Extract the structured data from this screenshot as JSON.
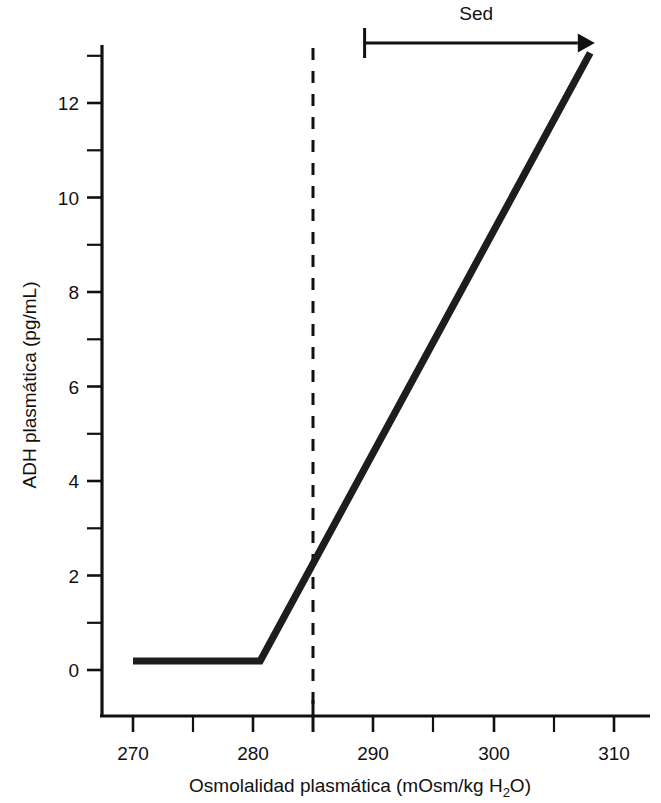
{
  "chart_data": {
    "type": "line",
    "title": "",
    "subtitle": "",
    "xlabel_parts": {
      "pre": "Osmolalidad plasmática (mOsm/kg H",
      "sub": "2",
      "post": "O)"
    },
    "xlabel": "Osmolalidad plasmática (mOsm/kg H2O)",
    "ylabel": "ADH plasmática (pg/mL)",
    "xlim": [
      266,
      312
    ],
    "ylim": [
      -0.7,
      13.6
    ],
    "grid": false,
    "legend": "none",
    "x_major_ticks": [
      270,
      280,
      290,
      300,
      310
    ],
    "x_major_tick_labels": [
      "270",
      "280",
      "290",
      "300",
      "310"
    ],
    "x_minor_ticks": [
      275,
      285,
      295,
      305
    ],
    "y_major_ticks": [
      0,
      2,
      4,
      6,
      8,
      10,
      12
    ],
    "y_major_tick_labels": [
      "0",
      "2",
      "4",
      "6",
      "8",
      "10",
      "12"
    ],
    "y_minor_ticks": [
      1,
      3,
      5,
      7,
      9,
      11,
      13
    ],
    "series": [
      {
        "name": "ADH plasmática",
        "color": "#1d1d1d",
        "x": [
          270.0,
          280.6,
          308.1
        ],
        "values": [
          0.19,
          0.19,
          13.06
        ]
      }
    ],
    "reference_lines": [
      {
        "name": "umbral-osmotico",
        "orientation": "vertical",
        "x": 285,
        "style": "dashed",
        "color": "#111111",
        "label": ""
      }
    ],
    "annotations": [
      {
        "name": "sed-range",
        "label": "Sed",
        "type": "arrow-range",
        "x_start": 289.3,
        "x_end": 307.9,
        "y": 13.3
      }
    ]
  },
  "axis": {
    "x_labels": [
      "270",
      "280",
      "290",
      "300",
      "310"
    ],
    "y_labels": [
      "0",
      "2",
      "4",
      "6",
      "8",
      "10",
      "12"
    ],
    "x_title_pre": "Osmolalidad plasmática (mOsm/kg H",
    "x_title_sub": "2",
    "x_title_post": "O)",
    "y_title": "ADH plasmática (pg/mL)"
  },
  "annotation": {
    "sed_label": "Sed"
  }
}
